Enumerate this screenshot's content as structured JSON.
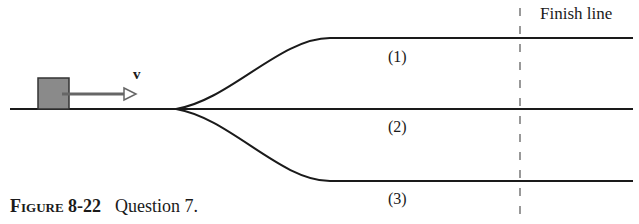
{
  "figure": {
    "finish_label": "Finish line",
    "velocity_label": "v",
    "paths": [
      {
        "label": "(1)"
      },
      {
        "label": "(2)"
      },
      {
        "label": "(3)"
      }
    ],
    "caption": {
      "figure_number": "Figure 8-22",
      "text": "Question 7."
    }
  }
}
